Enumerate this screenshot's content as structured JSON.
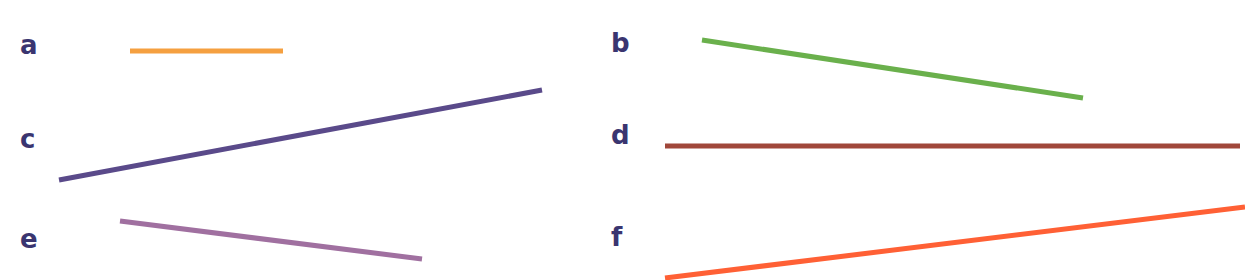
{
  "worksheet": {
    "items": [
      {
        "label": "a",
        "color": "#F5A040",
        "label_pos": [
          20,
          32
        ],
        "x1": 130,
        "y1": 51,
        "x2": 283,
        "y2": 51
      },
      {
        "label": "b",
        "color": "#6AB04C",
        "label_pos": [
          611,
          30
        ],
        "x1": 702,
        "y1": 40,
        "x2": 1083,
        "y2": 98
      },
      {
        "label": "c",
        "color": "#5A4A8A",
        "label_pos": [
          20,
          126
        ],
        "x1": 59,
        "y1": 180,
        "x2": 542,
        "y2": 90
      },
      {
        "label": "d",
        "color": "#A0473A",
        "label_pos": [
          611,
          122
        ],
        "x1": 665,
        "y1": 146,
        "x2": 1240,
        "y2": 146
      },
      {
        "label": "e",
        "color": "#A070A0",
        "label_pos": [
          20,
          226
        ],
        "x1": 120,
        "y1": 221,
        "x2": 422,
        "y2": 259
      },
      {
        "label": "f",
        "color": "#FF6035",
        "label_pos": [
          611,
          224
        ],
        "x1": 665,
        "y1": 278,
        "x2": 1245,
        "y2": 207
      }
    ],
    "label_color": "#3A3570",
    "line_width": 5
  }
}
